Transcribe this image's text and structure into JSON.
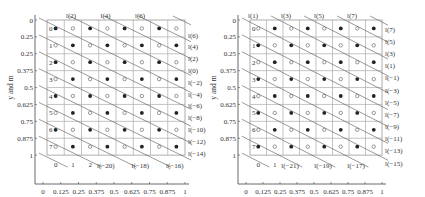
{
  "chart_data": [
    {
      "type": "scatter",
      "title": "",
      "xlabel": "x and n",
      "ylabel": "y and m",
      "x_ticks": [
        "0",
        "0.125",
        "0.25",
        "0.375",
        "0.5",
        "0.625",
        "0.75",
        "0.875",
        "1"
      ],
      "y_ticks": [
        "0",
        "0.25",
        "0.25",
        "0.375",
        "0.5",
        "0.625",
        "0.75",
        "0.875",
        "1"
      ],
      "row_labels": [
        "0",
        "1",
        "2",
        "3",
        "4",
        "5",
        "6",
        "7"
      ],
      "col_labels": [
        "0",
        "1",
        "2"
      ],
      "top_line_labels": [
        "l(2)",
        "l(4)",
        "l(6)"
      ],
      "right_line_labels": [
        "l(6)",
        "l(4)",
        "l(2)",
        "l(0)",
        "l(−2)",
        "l(−4)",
        "l(−6)",
        "l(−8)",
        "l(−10)",
        "l(−12)",
        "l(−14)"
      ],
      "bottom_line_labels": [
        "l(−20)",
        "l(−18)",
        "l(−16)"
      ],
      "grid": {
        "rows": 8,
        "cols": 8
      },
      "filled_pattern": "even parity: filled when (row+col) even",
      "legend": {
        "filled": "filled dot",
        "open": "open circle"
      }
    },
    {
      "type": "scatter",
      "title": "",
      "xlabel": "x and n",
      "ylabel": "y and m",
      "x_ticks": [
        "0",
        "0.125",
        "0.25",
        "0.375",
        "0.5",
        "0.625",
        "0.75",
        "0.875",
        "1"
      ],
      "y_ticks": [
        "0",
        "0.25",
        "0.25",
        "0.375",
        "0.5",
        "0.625",
        "0.75",
        "0.875",
        "1"
      ],
      "row_labels": [
        "0",
        "1",
        "2",
        "3",
        "4",
        "5",
        "6",
        "7"
      ],
      "col_labels": [
        "0",
        "1"
      ],
      "top_line_labels": [
        "l(1)",
        "l(3)",
        "l(5)",
        "l(7)"
      ],
      "right_line_labels": [
        "l(7)",
        "l(5)",
        "l(3)",
        "l(1)",
        "l(−1)",
        "l(−3)",
        "l(−5)",
        "l(−7)",
        "l(−9)",
        "l(−11)",
        "l(−13)",
        "l(−15)"
      ],
      "bottom_line_labels": [
        "l(−21)",
        "l(−19)",
        "l(−17)"
      ],
      "grid": {
        "rows": 8,
        "cols": 8
      },
      "filled_pattern": "odd parity: filled when (row+col) odd",
      "legend": {
        "filled": "filled dot",
        "open": "open circle"
      }
    }
  ]
}
